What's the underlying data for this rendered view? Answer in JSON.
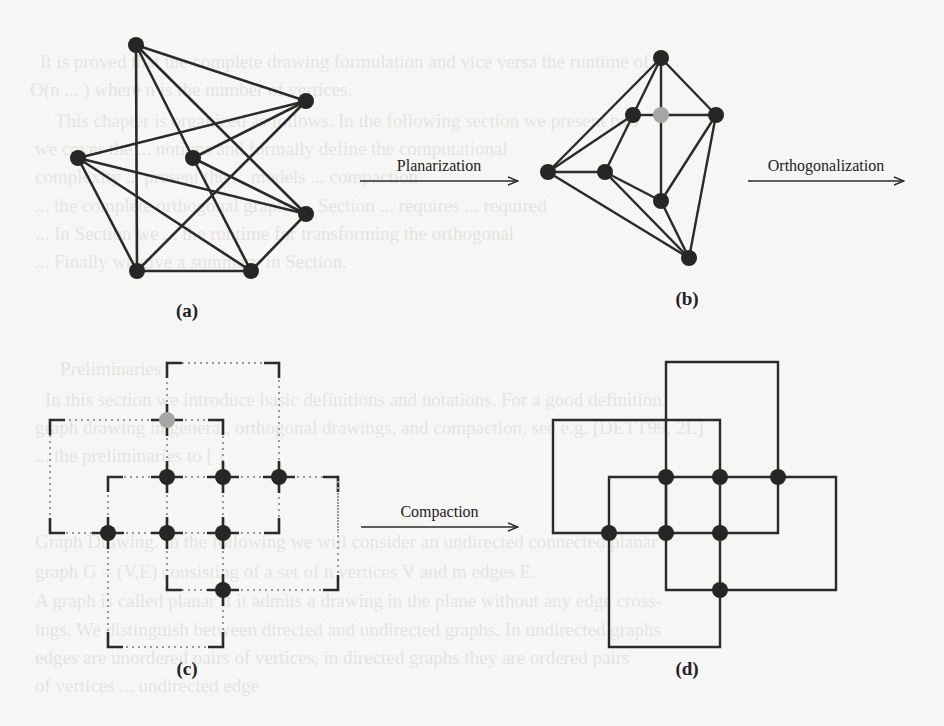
{
  "figure": {
    "arrows": [
      {
        "label": "Planarization",
        "x1": 360,
        "x2": 518,
        "y": 181
      },
      {
        "label": "Orthogonalization",
        "x1": 748,
        "x2": 904,
        "y": 181
      },
      {
        "label": "Compaction",
        "x1": 361,
        "x2": 518,
        "y": 527
      }
    ],
    "subfigure_labels": [
      {
        "text": "(a)",
        "x": 187,
        "y": 317
      },
      {
        "text": "(b)",
        "x": 687,
        "y": 305
      },
      {
        "text": "(c)",
        "x": 187,
        "y": 675
      },
      {
        "text": "(d)",
        "x": 687,
        "y": 675
      }
    ],
    "colors": {
      "vertex": "#262626",
      "dummy_vertex": "#a6a6a6",
      "edge": "#2a2a2a",
      "dotted": "#9a9a9a",
      "background": "#f6f6f4"
    },
    "graph_a": {
      "vertices": [
        [
          136,
          45
        ],
        [
          306,
          101
        ],
        [
          78,
          158
        ],
        [
          193,
          158
        ],
        [
          306,
          214
        ],
        [
          137,
          271
        ],
        [
          251,
          271
        ]
      ],
      "edges": [
        [
          0,
          1
        ],
        [
          0,
          5
        ],
        [
          0,
          3
        ],
        [
          0,
          4
        ],
        [
          1,
          2
        ],
        [
          1,
          3
        ],
        [
          1,
          5
        ],
        [
          2,
          4
        ],
        [
          2,
          5
        ],
        [
          2,
          6
        ],
        [
          3,
          4
        ],
        [
          3,
          6
        ],
        [
          4,
          6
        ],
        [
          5,
          6
        ]
      ]
    },
    "graph_b": {
      "vertices": [
        [
          661,
          58
        ],
        [
          633,
          115
        ],
        [
          661,
          115
        ],
        [
          716,
          115
        ],
        [
          548,
          172
        ],
        [
          605,
          172
        ],
        [
          661,
          201
        ],
        [
          689,
          258
        ]
      ],
      "dummy": [
        2
      ],
      "edges": [
        [
          0,
          4
        ],
        [
          0,
          1
        ],
        [
          0,
          2
        ],
        [
          0,
          3
        ],
        [
          1,
          2
        ],
        [
          2,
          3
        ],
        [
          2,
          6
        ],
        [
          1,
          4
        ],
        [
          1,
          5
        ],
        [
          4,
          5
        ],
        [
          4,
          7
        ],
        [
          5,
          6
        ],
        [
          5,
          7
        ],
        [
          6,
          7
        ],
        [
          6,
          3
        ],
        [
          3,
          7
        ]
      ]
    },
    "graph_c": {
      "vertices": [
        [
          167,
          477
        ],
        [
          223,
          477
        ],
        [
          279,
          477
        ],
        [
          108,
          533
        ],
        [
          167,
          533
        ],
        [
          223,
          533
        ],
        [
          223,
          590
        ]
      ],
      "dummy_vertices": [
        [
          167,
          420
        ]
      ],
      "paths": [
        [
          [
            167,
            420
          ],
          [
            167,
            363
          ],
          [
            279,
            363
          ],
          [
            279,
            477
          ]
        ],
        [
          [
            167,
            420
          ],
          [
            50,
            420
          ],
          [
            50,
            533
          ],
          [
            108,
            533
          ]
        ],
        [
          [
            167,
            420
          ],
          [
            223,
            420
          ],
          [
            223,
            477
          ]
        ],
        [
          [
            167,
            420
          ],
          [
            167,
            477
          ]
        ],
        [
          [
            108,
            533
          ],
          [
            108,
            477
          ],
          [
            167,
            477
          ]
        ],
        [
          [
            167,
            477
          ],
          [
            223,
            477
          ]
        ],
        [
          [
            223,
            477
          ],
          [
            279,
            477
          ]
        ],
        [
          [
            279,
            477
          ],
          [
            338,
            477
          ],
          [
            338,
            533
          ]
        ],
        [
          [
            108,
            533
          ],
          [
            167,
            533
          ]
        ],
        [
          [
            167,
            533
          ],
          [
            223,
            533
          ]
        ],
        [
          [
            223,
            533
          ],
          [
            279,
            533
          ],
          [
            279,
            477
          ]
        ],
        [
          [
            167,
            477
          ],
          [
            167,
            533
          ]
        ],
        [
          [
            223,
            477
          ],
          [
            223,
            533
          ]
        ],
        [
          [
            167,
            533
          ],
          [
            167,
            590
          ],
          [
            223,
            590
          ]
        ],
        [
          [
            223,
            533
          ],
          [
            223,
            590
          ]
        ],
        [
          [
            223,
            590
          ],
          [
            338,
            590
          ],
          [
            338,
            477
          ]
        ],
        [
          [
            108,
            533
          ],
          [
            108,
            647
          ],
          [
            223,
            647
          ],
          [
            223,
            590
          ]
        ]
      ]
    },
    "graph_d": {
      "vertices": [
        [
          666,
          477
        ],
        [
          720,
          477
        ],
        [
          778,
          477
        ],
        [
          609,
          533
        ],
        [
          666,
          533
        ],
        [
          720,
          533
        ],
        [
          720,
          590
        ]
      ],
      "segments": [
        [
          [
            666,
            533
          ],
          [
            666,
            362
          ],
          [
            778,
            362
          ],
          [
            778,
            477
          ]
        ],
        [
          [
            609,
            533
          ],
          [
            553,
            533
          ],
          [
            553,
            420
          ],
          [
            720,
            420
          ],
          [
            720,
            477
          ]
        ],
        [
          [
            609,
            533
          ],
          [
            609,
            477
          ],
          [
            836,
            477
          ],
          [
            836,
            590
          ],
          [
            720,
            590
          ]
        ],
        [
          [
            609,
            533
          ],
          [
            720,
            533
          ],
          [
            778,
            533
          ],
          [
            778,
            477
          ]
        ],
        [
          [
            666,
            477
          ],
          [
            666,
            590
          ],
          [
            720,
            590
          ]
        ],
        [
          [
            720,
            477
          ],
          [
            720,
            590
          ]
        ],
        [
          [
            609,
            533
          ],
          [
            609,
            647
          ],
          [
            720,
            647
          ],
          [
            720,
            590
          ]
        ]
      ]
    }
  },
  "bleed_text": [
    {
      "text": "It is proved that the complete drawing formulation and vice versa the runtime of",
      "x": 40,
      "y": 68
    },
    {
      "text": "O(n ... ) where n is the number of vertices.",
      "x": 30,
      "y": 96
    },
    {
      "text": "This chapter is organized as follows. In the following section we present two",
      "x": 55,
      "y": 127
    },
    {
      "text": "we cover the ... notions and formally define the computational",
      "x": 35,
      "y": 155
    },
    {
      "text": "complexity ... present the ... models ... compaction",
      "x": 35,
      "y": 183
    },
    {
      "text": "... the complete orthogonal graphs ... Section ... requires ... required",
      "x": 35,
      "y": 212
    },
    {
      "text": "... In Section we ... the runtime for transforming the orthogonal",
      "x": 35,
      "y": 240
    },
    {
      "text": "... Finally we give a summary in Section.",
      "x": 35,
      "y": 268
    },
    {
      "text": "Preliminaries",
      "x": 60,
      "y": 375
    },
    {
      "text": "In this section we introduce basic definitions and notations. For a good definition",
      "x": 45,
      "y": 406
    },
    {
      "text": "graph drawing in general, orthogonal drawings, and compaction, see e.g. [DETT99, 2L]",
      "x": 35,
      "y": 434
    },
    {
      "text": "... the preliminaries to [ ]",
      "x": 35,
      "y": 462
    },
    {
      "text": "Graph Drawing. In the following we will consider an undirected connected planar",
      "x": 35,
      "y": 548
    },
    {
      "text": "graph G = (V,E) consisting of a set of n vertices V and m edges E.",
      "x": 35,
      "y": 578
    },
    {
      "text": "A graph is called planar if it admits a drawing in the plane without any edge cross-",
      "x": 35,
      "y": 607
    },
    {
      "text": "ings. We distinguish between directed and undirected graphs. In undirected graphs",
      "x": 35,
      "y": 636
    },
    {
      "text": "edges are unordered pairs of vertices, in directed graphs they are ordered pairs",
      "x": 35,
      "y": 664
    },
    {
      "text": "of vertices ... undirected edge",
      "x": 35,
      "y": 692
    }
  ]
}
